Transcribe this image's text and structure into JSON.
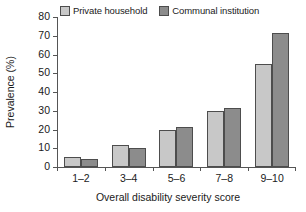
{
  "chart_data": {
    "type": "bar",
    "title": "",
    "subtitle": "",
    "xlabel": "Overall disability severity score",
    "ylabel": "Prevalence (%)",
    "categories": [
      "1–2",
      "3–4",
      "5–6",
      "7–8",
      "9–10"
    ],
    "series": [
      {
        "name": "Private household",
        "color": "#c8c8c8",
        "values": [
          5.3,
          11.8,
          20.0,
          29.8,
          54.7
        ]
      },
      {
        "name": "Communal institution",
        "color": "#8c8c8c",
        "values": [
          4.3,
          10.0,
          21.6,
          31.5,
          71.3
        ]
      }
    ],
    "ylim": [
      0,
      80
    ],
    "yticks": [
      0,
      10,
      20,
      30,
      40,
      50,
      60,
      70,
      80
    ],
    "ytick_labels": [
      "0",
      "10",
      "20",
      "30",
      "40",
      "50",
      "60",
      "70",
      "80"
    ],
    "grid": false,
    "legend_position": "top-left",
    "bar_border_color": "#4d4d4d",
    "axis_color": "#555555",
    "background": "#ffffff"
  },
  "legend": {
    "entries": [
      {
        "label": "Private household"
      },
      {
        "label": "Communal institution"
      }
    ]
  }
}
